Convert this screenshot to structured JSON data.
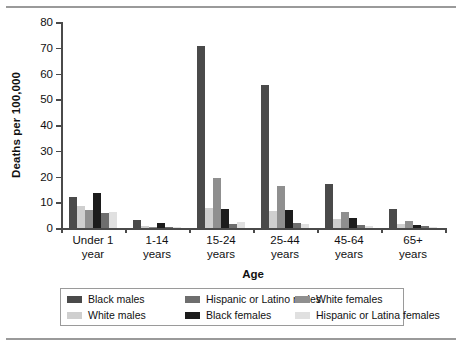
{
  "chart_data": {
    "type": "bar",
    "title": "",
    "xlabel": "Age",
    "ylabel": "Deaths per 100,000",
    "ylim": [
      0,
      80
    ],
    "yticks": [
      0,
      10,
      20,
      30,
      40,
      50,
      60,
      70,
      80
    ],
    "grid": false,
    "legend_position": "bottom",
    "categories": [
      "Under 1 year",
      "1-14 years",
      "15-24 years",
      "25-44 years",
      "45-64 years",
      "65+ years"
    ],
    "category_lines": [
      [
        "Under 1",
        "year"
      ],
      [
        "1-14",
        "years"
      ],
      [
        "15-24",
        "years"
      ],
      [
        "25-44",
        "years"
      ],
      [
        "45-64",
        "years"
      ],
      [
        "65+",
        "years"
      ]
    ],
    "series": [
      {
        "name": "Black males",
        "color": "#4a4a4a",
        "values": [
          12.0,
          3.3,
          70.5,
          55.5,
          17.0,
          7.5
        ]
      },
      {
        "name": "White males",
        "color": "#cfcfcf",
        "values": [
          8.4,
          0.8,
          7.9,
          6.6,
          3.6,
          1.6
        ]
      },
      {
        "name": "White females",
        "color": "#8f8f8f",
        "values": [
          6.9,
          0.4,
          19.4,
          16.2,
          6.3,
          2.6
        ]
      },
      {
        "name": "Black females",
        "color": "#1c1c1c",
        "values": [
          13.5,
          1.8,
          7.3,
          7.0,
          3.8,
          1.3
        ]
      },
      {
        "name": "Hispanic or Latino males",
        "color": "#6e6e6e",
        "values": [
          5.7,
          0.5,
          1.7,
          1.8,
          1.2,
          0.9
        ]
      },
      {
        "name": "Hispanic or Latina females",
        "color": "#e0e0e0",
        "values": [
          6.2,
          0.3,
          2.2,
          1.5,
          0.6,
          0.4
        ]
      }
    ],
    "legend_order": [
      {
        "name": "Black males",
        "color": "#4a4a4a"
      },
      {
        "name": "White males",
        "color": "#cfcfcf"
      },
      {
        "name": "Hispanic or Latino males",
        "color": "#6e6e6e"
      },
      {
        "name": "Black females",
        "color": "#1c1c1c"
      },
      {
        "name": "White females",
        "color": "#8f8f8f"
      },
      {
        "name": "Hispanic or Latina females",
        "color": "#e0e0e0"
      }
    ]
  }
}
